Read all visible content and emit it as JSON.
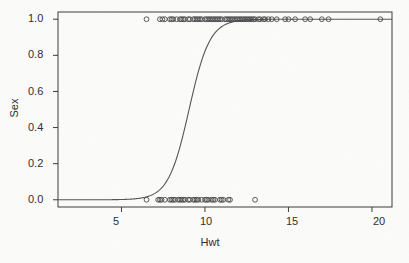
{
  "chart_data": {
    "type": "scatter",
    "title": "",
    "xlabel": "Hwt",
    "ylabel": "Sex",
    "xlim": [
      1.2,
      21.2
    ],
    "ylim": [
      -0.04,
      1.04
    ],
    "xticks": [
      5,
      10,
      15,
      20
    ],
    "yticks": [
      "0.0",
      "0.2",
      "0.4",
      "0.6",
      "0.8",
      "1.0"
    ],
    "ytick_values": [
      0.0,
      0.2,
      0.4,
      0.6,
      0.8,
      1.0
    ],
    "grid": false,
    "legend": "none",
    "marker": "open-circle",
    "series": [
      {
        "name": "Sex = 1 (male)",
        "y": 1,
        "x": [
          6.5,
          7.3,
          7.45,
          7.6,
          7.9,
          8.0,
          8.1,
          8.3,
          8.5,
          8.6,
          8.7,
          8.8,
          9.0,
          9.1,
          9.3,
          9.4,
          9.5,
          9.6,
          9.7,
          9.8,
          10.0,
          10.1,
          10.2,
          10.3,
          10.4,
          10.5,
          10.6,
          10.7,
          10.8,
          10.9,
          11.0,
          11.2,
          11.3,
          11.4,
          11.5,
          11.6,
          11.7,
          11.8,
          11.9,
          12.0,
          12.1,
          12.2,
          12.3,
          12.4,
          12.5,
          12.6,
          12.7,
          12.8,
          12.9,
          13.0,
          13.2,
          13.3,
          13.5,
          13.6,
          13.8,
          14.0,
          14.3,
          14.8,
          15.0,
          15.4,
          16.0,
          16.3,
          17.0,
          17.4,
          20.5
        ]
      },
      {
        "name": "Sex = 0 (female)",
        "y": 0,
        "x": [
          6.5,
          7.2,
          7.3,
          7.4,
          7.6,
          7.9,
          8.0,
          8.1,
          8.2,
          8.4,
          8.5,
          8.6,
          8.7,
          8.8,
          9.0,
          9.1,
          9.3,
          9.4,
          9.5,
          9.6,
          9.8,
          10.0,
          10.1,
          10.2,
          10.4,
          10.5,
          10.6,
          10.9,
          11.0,
          11.1,
          11.4,
          11.5,
          13.0
        ]
      }
    ],
    "fit_curve": {
      "name": "logistic fit",
      "midpoint_x": 9.05,
      "slope": 0.62,
      "y_at_xmin": 0.02,
      "y_at_xmax": 1.0
    }
  },
  "axes": {
    "x_title": "Hwt",
    "y_title": "Sex",
    "x_tick_labels": [
      "5",
      "10",
      "15",
      "20"
    ],
    "y_tick_labels": [
      "0.0",
      "0.2",
      "0.4",
      "0.6",
      "0.8",
      "1.0"
    ]
  },
  "colors": {
    "ink": "#3c3c3c",
    "curve": "#555555",
    "marker": "#4a4a4a",
    "background": "#fbfbfa"
  }
}
